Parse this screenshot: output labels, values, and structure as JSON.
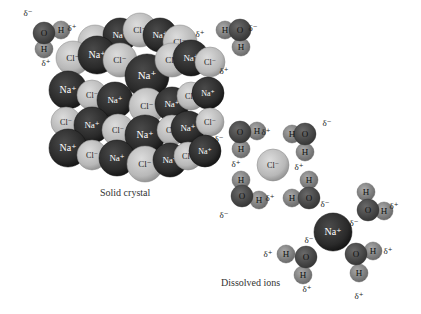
{
  "captions": {
    "solid": "Solid crystal",
    "dissolved": "Dissolved ions"
  },
  "colors": {
    "na": "#2c2c2c",
    "cl": "#bdbdbd",
    "oxygen": "#4a4a4a",
    "hydrogen": "#8a8a8a",
    "text_light": "#ffffff",
    "text_dark": "#222222"
  },
  "labels": {
    "na": "Na⁺",
    "cl": "Cl⁻",
    "o": "O",
    "h": "H",
    "delta_plus": "δ⁺",
    "delta_minus": "δ⁻"
  },
  "crystal": {
    "back": [
      {
        "ion": "cl",
        "x": 95,
        "y": 42
      },
      {
        "ion": "na",
        "x": 120,
        "y": 35
      },
      {
        "ion": "cl",
        "x": 140,
        "y": 30
      },
      {
        "ion": "na",
        "x": 160,
        "y": 35
      },
      {
        "ion": "cl",
        "x": 180,
        "y": 42
      }
    ],
    "atoms": [
      {
        "ion": "cl",
        "x": 73,
        "y": 58,
        "r": 17
      },
      {
        "ion": "na",
        "x": 97,
        "y": 55,
        "r": 19
      },
      {
        "ion": "cl",
        "x": 120,
        "y": 60,
        "r": 17
      },
      {
        "ion": "na",
        "x": 147,
        "y": 76,
        "r": 22
      },
      {
        "ion": "cl",
        "x": 172,
        "y": 60,
        "r": 17
      },
      {
        "ion": "na",
        "x": 191,
        "y": 58,
        "r": 18
      },
      {
        "ion": "cl",
        "x": 210,
        "y": 62,
        "r": 15
      },
      {
        "ion": "na",
        "x": 68,
        "y": 90,
        "r": 19
      },
      {
        "ion": "cl",
        "x": 92,
        "y": 95,
        "r": 15
      },
      {
        "ion": "na",
        "x": 115,
        "y": 100,
        "r": 18
      },
      {
        "ion": "cl",
        "x": 147,
        "y": 106,
        "r": 18
      },
      {
        "ion": "na",
        "x": 172,
        "y": 104,
        "r": 17
      },
      {
        "ion": "cl",
        "x": 191,
        "y": 96,
        "r": 14
      },
      {
        "ion": "na",
        "x": 208,
        "y": 93,
        "r": 16
      },
      {
        "ion": "cl",
        "x": 66,
        "y": 122,
        "r": 15
      },
      {
        "ion": "na",
        "x": 92,
        "y": 125,
        "r": 18
      },
      {
        "ion": "cl",
        "x": 118,
        "y": 130,
        "r": 16
      },
      {
        "ion": "na",
        "x": 145,
        "y": 135,
        "r": 20
      },
      {
        "ion": "cl",
        "x": 172,
        "y": 130,
        "r": 15
      },
      {
        "ion": "na",
        "x": 188,
        "y": 128,
        "r": 17
      },
      {
        "ion": "cl",
        "x": 210,
        "y": 122,
        "r": 14
      },
      {
        "ion": "na",
        "x": 68,
        "y": 148,
        "r": 19
      },
      {
        "ion": "cl",
        "x": 92,
        "y": 155,
        "r": 15
      },
      {
        "ion": "na",
        "x": 117,
        "y": 158,
        "r": 18
      },
      {
        "ion": "cl",
        "x": 145,
        "y": 164,
        "r": 18
      },
      {
        "ion": "na",
        "x": 170,
        "y": 160,
        "r": 17
      },
      {
        "ion": "cl",
        "x": 188,
        "y": 156,
        "r": 14
      },
      {
        "ion": "na",
        "x": 205,
        "y": 151,
        "r": 16
      }
    ]
  },
  "water": [
    {
      "o": [
        44,
        33
      ],
      "h": [
        [
          61,
          30
        ],
        [
          44,
          49
        ]
      ],
      "deltas": [
        {
          "t": "delta_minus",
          "x": 28,
          "y": 16
        },
        {
          "t": "delta_plus",
          "x": 72,
          "y": 31
        },
        {
          "t": "delta_plus",
          "x": 46,
          "y": 66
        }
      ]
    },
    {
      "o": [
        240,
        30
      ],
      "h": [
        [
          225,
          30
        ],
        [
          241,
          47
        ]
      ],
      "deltas": [
        {
          "t": "delta_plus",
          "x": 200,
          "y": 37
        },
        {
          "t": "delta_minus",
          "x": 253,
          "y": 31
        },
        {
          "t": "delta_plus",
          "x": 224,
          "y": 74
        }
      ]
    },
    {
      "o": [
        240,
        132
      ],
      "h": [
        [
          257,
          131
        ],
        [
          241,
          149
        ]
      ],
      "deltas": [
        {
          "t": "delta_minus",
          "x": 219,
          "y": 142
        },
        {
          "t": "delta_plus",
          "x": 266,
          "y": 135
        },
        {
          "t": "delta_plus",
          "x": 236,
          "y": 167
        }
      ]
    },
    {
      "o": [
        305,
        134
      ],
      "h": [
        [
          292,
          134
        ],
        [
          305,
          152
        ]
      ],
      "deltas": [
        {
          "t": "delta_minus",
          "x": 327,
          "y": 126
        },
        {
          "t": "delta_plus",
          "x": 299,
          "y": 170
        }
      ]
    },
    {
      "o": [
        242,
        196
      ],
      "h": [
        [
          241,
          180
        ],
        [
          259,
          200
        ]
      ],
      "deltas": [
        {
          "t": "delta_plus",
          "x": 270,
          "y": 201
        },
        {
          "t": "delta_minus",
          "x": 224,
          "y": 218
        }
      ]
    },
    {
      "o": [
        309,
        198
      ],
      "h": [
        [
          309,
          180
        ],
        [
          292,
          198
        ]
      ],
      "deltas": [
        {
          "t": "delta_minus",
          "x": 325,
          "y": 207
        }
      ]
    },
    {
      "o": [
        368,
        210
      ],
      "h": [
        [
          366,
          192
        ],
        [
          384,
          211
        ]
      ],
      "deltas": [
        {
          "t": "delta_plus",
          "x": 394,
          "y": 209
        },
        {
          "t": "delta_minus",
          "x": 354,
          "y": 226
        }
      ]
    },
    {
      "o": [
        306,
        257
      ],
      "h": [
        [
          286,
          254
        ],
        [
          303,
          275
        ]
      ],
      "deltas": [
        {
          "t": "delta_plus",
          "x": 268,
          "y": 257
        },
        {
          "t": "delta_minus",
          "x": 309,
          "y": 243
        },
        {
          "t": "delta_plus",
          "x": 307,
          "y": 292
        }
      ]
    },
    {
      "o": [
        356,
        254
      ],
      "h": [
        [
          373,
          251
        ],
        [
          359,
          273
        ]
      ],
      "deltas": [
        {
          "t": "delta_minus",
          "x": 346,
          "y": 245
        },
        {
          "t": "delta_plus",
          "x": 388,
          "y": 254
        },
        {
          "t": "delta_plus",
          "x": 359,
          "y": 299
        }
      ]
    }
  ],
  "free_ions": [
    {
      "ion": "cl",
      "x": 273,
      "y": 165,
      "r": 16
    },
    {
      "ion": "na",
      "x": 333,
      "y": 232,
      "r": 19
    }
  ]
}
